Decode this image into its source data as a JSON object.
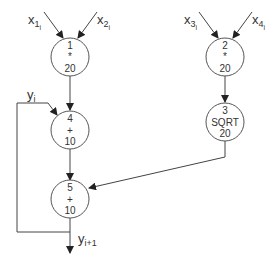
{
  "diagram": {
    "type": "dataflow-graph",
    "nodes": [
      {
        "id": "1",
        "op": "*",
        "cost": "20"
      },
      {
        "id": "2",
        "op": "*",
        "cost": "20"
      },
      {
        "id": "3",
        "op": "SQRT",
        "cost": "20"
      },
      {
        "id": "4",
        "op": "+",
        "cost": "10"
      },
      {
        "id": "5",
        "op": "+",
        "cost": "10"
      }
    ],
    "inputs": [
      {
        "base": "x",
        "sub": "1",
        "subsub": "i",
        "to": "1"
      },
      {
        "base": "x",
        "sub": "2",
        "subsub": "i",
        "to": "1"
      },
      {
        "base": "x",
        "sub": "3",
        "subsub": "i",
        "to": "2"
      },
      {
        "base": "x",
        "sub": "4",
        "subsub": "i",
        "to": "2"
      }
    ],
    "feedback_input": {
      "base": "y",
      "sub": "i",
      "to": "4"
    },
    "output": {
      "base": "y",
      "sub": "i+1",
      "from": "5"
    },
    "edges": [
      {
        "from": "1",
        "to": "4"
      },
      {
        "from": "2",
        "to": "3"
      },
      {
        "from": "3",
        "to": "5"
      },
      {
        "from": "4",
        "to": "5"
      },
      {
        "from": "5",
        "to": "4",
        "label": "feedback loop"
      }
    ],
    "colors": {
      "stroke": "#444444",
      "text": "#333333",
      "background": "#ffffff"
    }
  }
}
